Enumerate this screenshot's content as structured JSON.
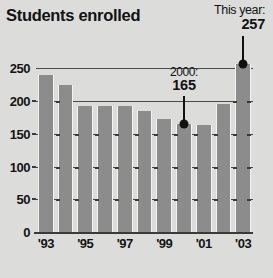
{
  "chart_data": {
    "type": "bar",
    "title": "Students enrolled",
    "xlabel": "",
    "ylabel": "",
    "categories": [
      "'93",
      "'94",
      "'95",
      "'96",
      "'97",
      "'98",
      "'99",
      "'00",
      "'01",
      "'02",
      "'03"
    ],
    "values": [
      240,
      225,
      193,
      192,
      192,
      185,
      172,
      165,
      163,
      196,
      257
    ],
    "ylim": [
      0,
      275
    ],
    "yticks": [
      0,
      50,
      100,
      150,
      200,
      250
    ],
    "ytick_labels": [
      "0",
      "50",
      "100",
      "150",
      "200",
      "250"
    ],
    "xtick_labels": [
      "'93",
      "'95",
      "'97",
      "'99",
      "'01",
      "'03"
    ],
    "xtick_indices": [
      0,
      2,
      4,
      6,
      8,
      10
    ],
    "grid": "horizontal-major",
    "legend": "none",
    "annotations": [
      {
        "name": "this-year",
        "label": "This year:",
        "value": "257",
        "target_category": "'03",
        "target_value": 257
      },
      {
        "name": "year-2000",
        "label": "2000:",
        "value": "165",
        "target_category": "'00",
        "target_value": 165
      }
    ],
    "colors": {
      "background": "#dcdcdb",
      "bar": "#8c8c8c",
      "bar_gap": "#f4f4f4",
      "text": "#121212",
      "gridline": "#4a4a4a",
      "annotation": "#111111"
    }
  }
}
